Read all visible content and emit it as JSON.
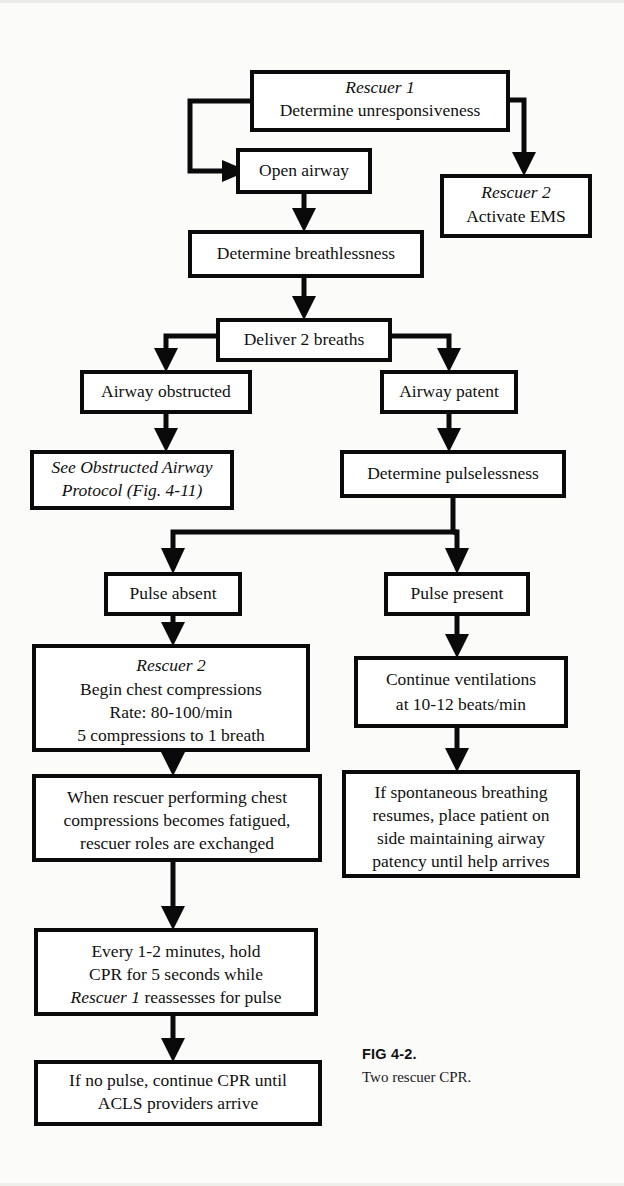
{
  "figure": {
    "caption_label": "FIG 4-2.",
    "caption_text": "Two rescuer CPR."
  },
  "colors": {
    "ink": "#0a0a0a",
    "box_fill": "#ffffff",
    "page_bg": "#fbfbfa"
  },
  "flowchart": {
    "type": "flowchart",
    "title": "Two rescuer CPR",
    "nodes": [
      {
        "id": "rescuer1",
        "x": 252,
        "y": 72,
        "w": 256,
        "h": 58,
        "lines": [
          {
            "text": "Rescuer 1",
            "italic": true
          },
          {
            "text": "Determine unresponsiveness",
            "italic": false
          }
        ]
      },
      {
        "id": "open-airway",
        "x": 238,
        "y": 150,
        "w": 132,
        "h": 42,
        "lines": [
          {
            "text": "Open airway",
            "italic": false
          }
        ]
      },
      {
        "id": "rescuer2-ems",
        "x": 442,
        "y": 176,
        "w": 148,
        "h": 60,
        "lines": [
          {
            "text": "Rescuer 2",
            "italic": true
          },
          {
            "text": "Activate EMS",
            "italic": false
          }
        ]
      },
      {
        "id": "determine-breathlessness",
        "x": 190,
        "y": 232,
        "w": 232,
        "h": 44,
        "lines": [
          {
            "text": "Determine breathlessness",
            "italic": false
          }
        ]
      },
      {
        "id": "deliver-2-breaths",
        "x": 218,
        "y": 320,
        "w": 172,
        "h": 40,
        "lines": [
          {
            "text": "Deliver 2 breaths",
            "italic": false
          }
        ]
      },
      {
        "id": "airway-obstructed",
        "x": 82,
        "y": 372,
        "w": 168,
        "h": 40,
        "lines": [
          {
            "text": "Airway obstructed",
            "italic": false
          }
        ]
      },
      {
        "id": "airway-patent",
        "x": 382,
        "y": 372,
        "w": 134,
        "h": 40,
        "lines": [
          {
            "text": "Airway patent",
            "italic": false
          }
        ]
      },
      {
        "id": "obstructed-protocol",
        "x": 32,
        "y": 452,
        "w": 200,
        "h": 56,
        "lines": [
          {
            "text": "See Obstructed Airway",
            "italic": true
          },
          {
            "text": "Protocol (Fig. 4-11)",
            "italic": true
          }
        ]
      },
      {
        "id": "determine-pulselessness",
        "x": 342,
        "y": 452,
        "w": 222,
        "h": 44,
        "lines": [
          {
            "text": "Determine pulselessness",
            "italic": false
          }
        ]
      },
      {
        "id": "pulse-absent",
        "x": 106,
        "y": 574,
        "w": 134,
        "h": 40,
        "lines": [
          {
            "text": "Pulse absent",
            "italic": false
          }
        ]
      },
      {
        "id": "pulse-present",
        "x": 386,
        "y": 574,
        "w": 142,
        "h": 40,
        "lines": [
          {
            "text": "Pulse present",
            "italic": false
          }
        ]
      },
      {
        "id": "begin-compressions",
        "x": 34,
        "y": 646,
        "w": 274,
        "h": 104,
        "lines": [
          {
            "text": "Rescuer 2",
            "italic": true
          },
          {
            "text": "Begin chest compressions",
            "italic": false
          },
          {
            "text": "Rate: 80-100/min",
            "italic": false
          },
          {
            "text": "5 compressions to 1 breath",
            "italic": false
          }
        ]
      },
      {
        "id": "continue-ventilations",
        "x": 356,
        "y": 658,
        "w": 210,
        "h": 68,
        "lines": [
          {
            "text": "Continue ventilations",
            "italic": false
          },
          {
            "text": "at 10-12 beats/min",
            "italic": false
          }
        ]
      },
      {
        "id": "roles-exchanged",
        "x": 34,
        "y": 776,
        "w": 286,
        "h": 84,
        "lines": [
          {
            "text": "When rescuer performing chest",
            "italic": false
          },
          {
            "text": "compressions becomes fatigued,",
            "italic": false
          },
          {
            "text": "rescuer roles are exchanged",
            "italic": false
          }
        ]
      },
      {
        "id": "spontaneous-breathing",
        "x": 344,
        "y": 772,
        "w": 234,
        "h": 104,
        "lines": [
          {
            "text": "If spontaneous breathing",
            "italic": false
          },
          {
            "text": "resumes, place patient on",
            "italic": false
          },
          {
            "text": "side maintaining airway",
            "italic": false
          },
          {
            "text": "patency until help arrives",
            "italic": false
          }
        ]
      },
      {
        "id": "reassess-pulse",
        "x": 36,
        "y": 930,
        "w": 280,
        "h": 84,
        "lines": [
          {
            "text": "Every 1-2 minutes, hold",
            "italic": false
          },
          {
            "text": "CPR for 5 seconds while",
            "italic": false
          },
          {
            "text": "Rescuer 1 reassesses for pulse",
            "italic": false,
            "lead_italic": "Rescuer 1"
          }
        ]
      },
      {
        "id": "acls-arrive",
        "x": 36,
        "y": 1062,
        "w": 284,
        "h": 62,
        "lines": [
          {
            "text": "If no pulse, continue CPR until",
            "italic": false
          },
          {
            "text": "ACLS providers arrive",
            "italic": false
          }
        ]
      }
    ],
    "edges": [
      {
        "from": "rescuer1",
        "to": "open-airway",
        "label": ""
      },
      {
        "from": "rescuer1",
        "to": "rescuer2-ems",
        "label": ""
      },
      {
        "from": "open-airway",
        "to": "determine-breathlessness",
        "label": ""
      },
      {
        "from": "determine-breathlessness",
        "to": "deliver-2-breaths",
        "label": ""
      },
      {
        "from": "deliver-2-breaths",
        "to": "airway-obstructed",
        "label": ""
      },
      {
        "from": "deliver-2-breaths",
        "to": "airway-patent",
        "label": ""
      },
      {
        "from": "airway-obstructed",
        "to": "obstructed-protocol",
        "label": ""
      },
      {
        "from": "airway-patent",
        "to": "determine-pulselessness",
        "label": ""
      },
      {
        "from": "determine-pulselessness",
        "to": "pulse-absent",
        "label": ""
      },
      {
        "from": "determine-pulselessness",
        "to": "pulse-present",
        "label": ""
      },
      {
        "from": "pulse-absent",
        "to": "begin-compressions",
        "label": ""
      },
      {
        "from": "pulse-present",
        "to": "continue-ventilations",
        "label": ""
      },
      {
        "from": "begin-compressions",
        "to": "roles-exchanged",
        "label": ""
      },
      {
        "from": "continue-ventilations",
        "to": "spontaneous-breathing",
        "label": ""
      },
      {
        "from": "roles-exchanged",
        "to": "reassess-pulse",
        "label": ""
      },
      {
        "from": "reassess-pulse",
        "to": "acls-arrive",
        "label": ""
      }
    ]
  }
}
